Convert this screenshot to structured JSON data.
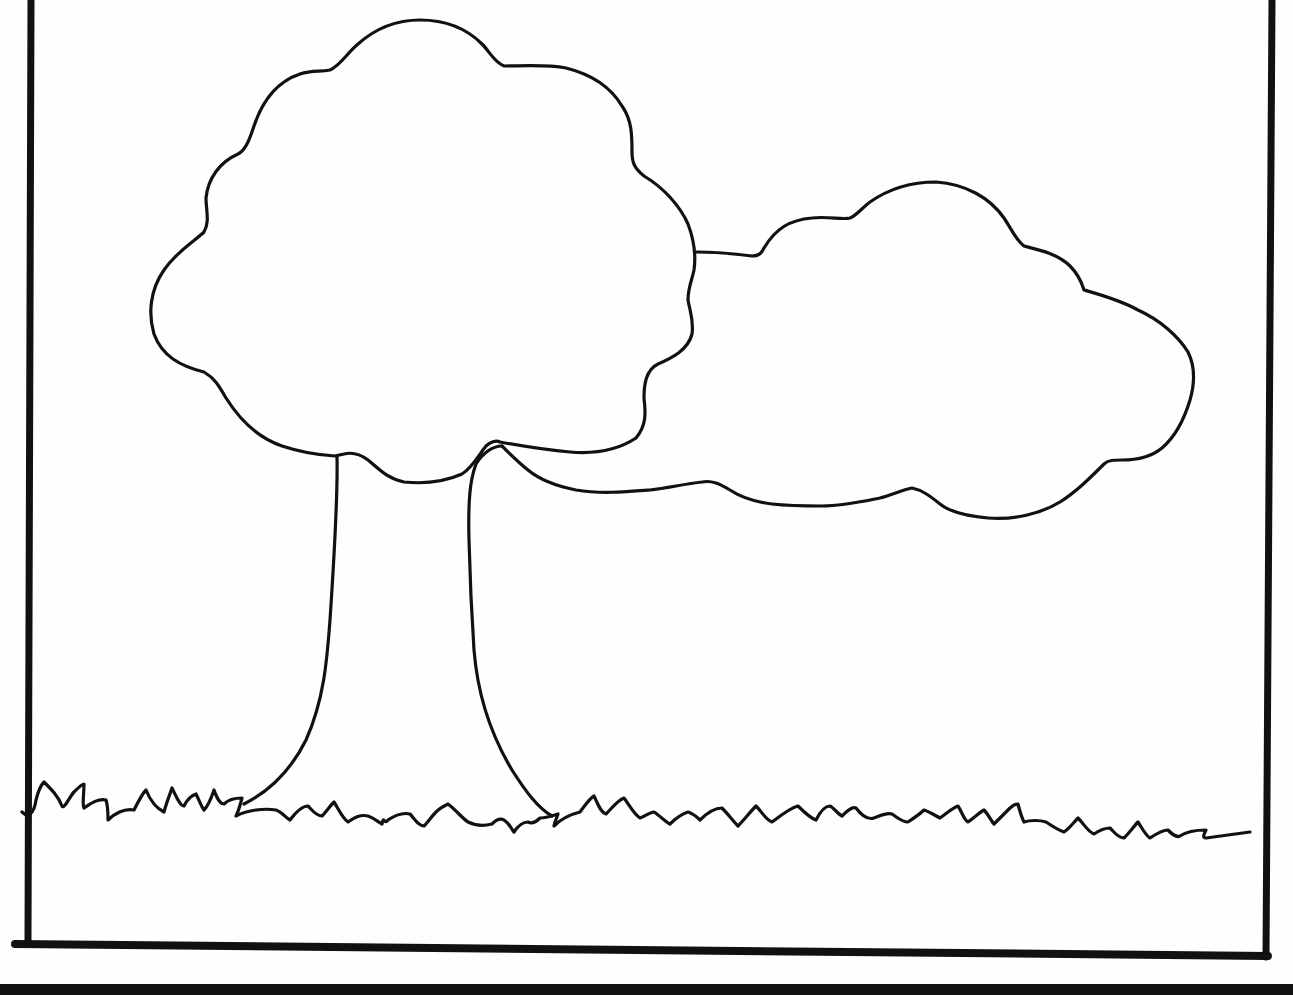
{
  "page": {
    "type": "coloring-page",
    "background_color": "#ffffff",
    "line_color": "#111111"
  },
  "frame": {
    "stroke_width": 7,
    "bottom_stroke_width": 10
  },
  "elements": {
    "tree_canopy": {
      "label": "tree canopy"
    },
    "tree_canopy_side": {
      "label": "tree canopy side lobe"
    },
    "tree_trunk": {
      "label": "tree trunk"
    },
    "grass": {
      "label": "grass line"
    },
    "bottom_bar": {
      "label": "bottom edge bar"
    }
  }
}
